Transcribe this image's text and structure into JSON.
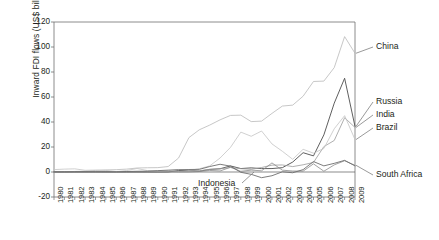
{
  "chart_data": {
    "type": "line",
    "title": "",
    "xlabel": "",
    "ylabel": "Inward FDI flows (US$ billion)",
    "ylim": [
      -20,
      120
    ],
    "yticks": [
      120,
      100,
      80,
      60,
      40,
      20,
      0,
      -20
    ],
    "xlim": [
      1980,
      2009
    ],
    "grid": false,
    "legend_position": "right-of-axes",
    "x": [
      1980,
      1981,
      1982,
      1983,
      1984,
      1985,
      1986,
      1987,
      1988,
      1989,
      1990,
      1991,
      1992,
      1993,
      1994,
      1995,
      1996,
      1997,
      1998,
      1999,
      2000,
      2001,
      2002,
      2003,
      2004,
      2005,
      2006,
      2007,
      2008,
      2009
    ],
    "series": [
      {
        "name": "China",
        "color": "#b9b9b9",
        "label_y_px": 50,
        "values": [
          0.06,
          0.27,
          0.43,
          0.64,
          1.26,
          1.66,
          1.87,
          2.31,
          3.19,
          3.39,
          3.49,
          4.37,
          11.16,
          27.52,
          33.77,
          37.52,
          41.73,
          45.26,
          45.46,
          40.32,
          40.71,
          46.88,
          52.74,
          53.51,
          60.63,
          72.41,
          72.72,
          83.52,
          108.31,
          95.0
        ]
      },
      {
        "name": "Russia",
        "color": "#4d4d4d",
        "label_y_px": 105,
        "values": [
          0,
          0,
          0,
          0,
          0,
          0,
          0,
          0,
          0,
          0,
          0,
          0,
          1.16,
          1.21,
          0.64,
          2.07,
          2.58,
          4.87,
          2.76,
          3.31,
          2.71,
          2.75,
          3.46,
          7.96,
          15.44,
          12.89,
          29.7,
          55.07,
          75.0,
          36.5
        ]
      },
      {
        "name": "India",
        "color": "#9a9a9a",
        "label_y_px": 118,
        "values": [
          0.08,
          0.09,
          0.07,
          0.01,
          0.02,
          0.11,
          0.12,
          0.21,
          0.09,
          0.25,
          0.24,
          0.07,
          0.28,
          0.55,
          0.97,
          2.15,
          2.53,
          3.62,
          2.63,
          2.17,
          3.59,
          5.48,
          5.63,
          4.32,
          5.77,
          7.62,
          20.33,
          25.23,
          43.41,
          35.65
        ]
      },
      {
        "name": "Brazil",
        "color": "#c4c4c4",
        "label_y_px": 131,
        "values": [
          1.91,
          2.31,
          2.53,
          1.37,
          1.56,
          1.27,
          0.32,
          1.17,
          2.8,
          1.13,
          0.99,
          1.1,
          2.06,
          1.29,
          2.59,
          4.86,
          11.2,
          19.65,
          31.91,
          28.58,
          32.78,
          22.46,
          16.59,
          10.14,
          18.15,
          15.07,
          18.82,
          34.58,
          45.06,
          25.95
        ]
      },
      {
        "name": "South Africa",
        "color": "#8a8a8a",
        "label_y_px": 178,
        "values": [
          -0.06,
          -0.01,
          0.13,
          0.09,
          0.3,
          -0.39,
          -0.1,
          -0.06,
          -0.02,
          -0.01,
          -0.08,
          0.25,
          0.01,
          0.01,
          0.37,
          1.25,
          0.82,
          3.81,
          0.55,
          1.5,
          0.97,
          7.27,
          1.48,
          0.78,
          0.7,
          6.52,
          0.62,
          5.69,
          9.01,
          5.37
        ]
      },
      {
        "name": "Indonesia",
        "color": "#6e6e6e",
        "label_y_px": 188,
        "label_x_px": 198,
        "values": [
          0.18,
          0.13,
          0.22,
          0.29,
          0.22,
          0.31,
          0.26,
          0.39,
          0.58,
          0.68,
          1.09,
          1.48,
          1.78,
          2.0,
          2.11,
          4.35,
          6.19,
          4.68,
          -0.24,
          -1.87,
          -4.55,
          -2.98,
          0.15,
          -0.6,
          1.9,
          8.34,
          4.91,
          6.93,
          9.32,
          4.88
        ]
      }
    ]
  },
  "axis": {
    "y_title": "Inward FDI flows (US$ billion)",
    "y_labels": [
      "120",
      "100",
      "80",
      "60",
      "40",
      "20",
      "0",
      "-20"
    ],
    "x_labels": [
      "1980",
      "1981",
      "1982",
      "1983",
      "1984",
      "1985",
      "1986",
      "1987",
      "1988",
      "1989",
      "1990",
      "1991",
      "1992",
      "1993",
      "1994",
      "1995",
      "1996",
      "1997",
      "1998",
      "1999",
      "2000",
      "2001",
      "2002",
      "2003",
      "2004",
      "2005",
      "2006",
      "2007",
      "2008",
      "2009"
    ]
  },
  "annotations": {
    "china": "China",
    "russia": "Russia",
    "india": "India",
    "brazil": "Brazil",
    "south_africa": "South Africa",
    "indonesia": "Indonesia"
  }
}
